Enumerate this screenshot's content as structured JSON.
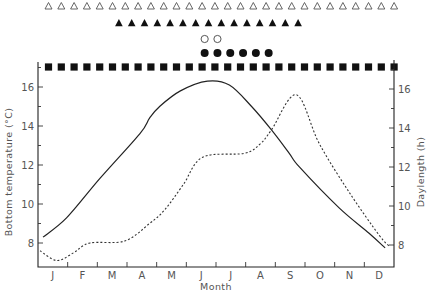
{
  "chart_data": {
    "type": "line",
    "title": "",
    "xlabel": "Month",
    "ylabel": "Bottom temperature (°C)",
    "ylabel_right": "Daylength (h)",
    "categories": [
      "J",
      "F",
      "M",
      "A",
      "M",
      "J",
      "J",
      "A",
      "S",
      "O",
      "N",
      "D"
    ],
    "ylim": [
      7.2,
      17.2
    ],
    "yticks": [
      8,
      10,
      12,
      14,
      16
    ],
    "yticks_right": [
      8,
      10,
      12,
      14,
      16
    ],
    "grid": false,
    "legend": null,
    "series": [
      {
        "name": "Bottom temperature (°C)",
        "style": "solid",
        "axis": "left",
        "points": [
          [
            0.17,
            8.3
          ],
          [
            0.97,
            9.3
          ],
          [
            2.08,
            11.3
          ],
          [
            3.43,
            13.6
          ],
          [
            3.76,
            14.4
          ],
          [
            4.1,
            15.0
          ],
          [
            4.8,
            15.8
          ],
          [
            5.71,
            16.3
          ],
          [
            6.45,
            16.1
          ],
          [
            7.2,
            15.0
          ],
          [
            7.87,
            13.8
          ],
          [
            8.47,
            12.6
          ],
          [
            8.81,
            11.9
          ],
          [
            10.15,
            9.8
          ],
          [
            11.16,
            8.5
          ],
          [
            11.7,
            7.75
          ]
        ]
      },
      {
        "name": "Daylength (h)",
        "style": "dotted",
        "axis": "right",
        "points": [
          [
            0.07,
            7.6
          ],
          [
            0.64,
            7.1
          ],
          [
            1.2,
            7.5
          ],
          [
            1.75,
            8.0
          ],
          [
            2.92,
            8.1
          ],
          [
            3.76,
            9.0
          ],
          [
            4.27,
            9.7
          ],
          [
            4.9,
            11.0
          ],
          [
            5.55,
            12.4
          ],
          [
            6.96,
            12.6
          ],
          [
            7.5,
            13.1
          ],
          [
            7.87,
            13.8
          ],
          [
            8.71,
            15.6
          ],
          [
            9.48,
            13.1
          ],
          [
            10.49,
            10.6
          ],
          [
            11.5,
            8.4
          ],
          [
            11.87,
            7.8
          ]
        ]
      }
    ],
    "symbol_rows": [
      {
        "name": "open-triangles",
        "marker": "open-triangle",
        "count": 28,
        "start_week": 0,
        "y": 6
      },
      {
        "name": "filled-triangles",
        "marker": "filled-triangle",
        "count": 15,
        "start_week": 5.5,
        "y": 23
      },
      {
        "name": "open-circles",
        "marker": "open-circle",
        "count": 2,
        "start_week": 12.2,
        "y": 39
      },
      {
        "name": "filled-circles",
        "marker": "filled-circle",
        "count": 6,
        "start_week": 12.2,
        "y": 53
      },
      {
        "name": "filled-squares",
        "marker": "filled-square",
        "count": 28,
        "start_week": 0,
        "y": 67
      }
    ]
  }
}
